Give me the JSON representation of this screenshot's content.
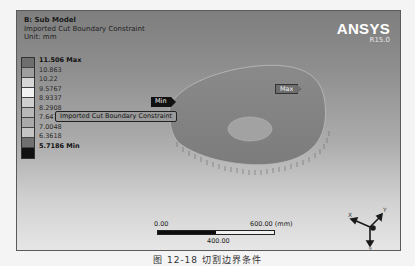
{
  "header": {
    "title": "B: Sub Model",
    "subtitle": "Imported Cut Boundary Constraint",
    "unit": "Unit: mm"
  },
  "logo": {
    "brand": "ANSYS",
    "version": "R15.0"
  },
  "legend": {
    "entries": [
      {
        "label": "11.506 Max",
        "color": "#6e6e6e",
        "bold": true
      },
      {
        "label": "10.863",
        "color": "#9e9e9e",
        "bold": false
      },
      {
        "label": "10.22",
        "color": "#d6d6d6",
        "bold": false
      },
      {
        "label": "9.5767",
        "color": "#f2f2f2",
        "bold": false
      },
      {
        "label": "8.9337",
        "color": "#cfcfcf",
        "bold": false
      },
      {
        "label": "8.2908",
        "color": "#b8b8b8",
        "bold": false
      },
      {
        "label": "7.6478",
        "color": "#a9a9a9",
        "bold": false
      },
      {
        "label": "7.0048",
        "color": "#c4c4c4",
        "bold": false
      },
      {
        "label": "6.3618",
        "color": "#707070",
        "bold": false
      },
      {
        "label": "5.7186 Min",
        "color": "#111111",
        "bold": true
      }
    ]
  },
  "annotations": {
    "min_tag": "Min",
    "max_tag": "Max",
    "boundary_tag": "Imported Cut Boundary Constraint"
  },
  "scale_bar": {
    "start": "0.00",
    "mid": "400.00",
    "end": "600.00 (mm)"
  },
  "triad": {
    "x_label": "X",
    "y_label": "Y",
    "z_label": "Z"
  },
  "caption": "图 12-18   切割边界条件"
}
